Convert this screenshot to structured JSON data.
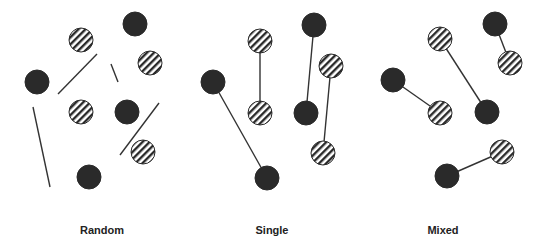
{
  "colors": {
    "dark": "#2a2a2a",
    "hatch": "#2a2a2a",
    "line": "#333333",
    "background": "#ffffff"
  },
  "circle_radius": 12,
  "panels": [
    {
      "label": "Random",
      "label_x": 102,
      "circles": [
        {
          "type": "hatched",
          "x": 81,
          "y": 40
        },
        {
          "type": "dark",
          "x": 135,
          "y": 24
        },
        {
          "type": "hatched",
          "x": 150,
          "y": 63
        },
        {
          "type": "dark",
          "x": 37,
          "y": 82
        },
        {
          "type": "hatched",
          "x": 81,
          "y": 112
        },
        {
          "type": "dark",
          "x": 127,
          "y": 112
        },
        {
          "type": "hatched",
          "x": 143,
          "y": 152
        },
        {
          "type": "dark",
          "x": 89,
          "y": 177
        }
      ],
      "lines": [
        {
          "x1": 58,
          "y1": 94,
          "x2": 97,
          "y2": 54
        },
        {
          "x1": 111,
          "y1": 64,
          "x2": 118,
          "y2": 82
        },
        {
          "x1": 33,
          "y1": 107,
          "x2": 50,
          "y2": 187
        },
        {
          "x1": 120,
          "y1": 155,
          "x2": 159,
          "y2": 103
        }
      ]
    },
    {
      "label": "Single",
      "label_x": 272,
      "circles": [
        {
          "type": "hatched",
          "x": 260,
          "y": 41
        },
        {
          "type": "hatched",
          "x": 260,
          "y": 113
        },
        {
          "type": "dark",
          "x": 314,
          "y": 25
        },
        {
          "type": "dark",
          "x": 306,
          "y": 113
        },
        {
          "type": "hatched",
          "x": 331,
          "y": 66
        },
        {
          "type": "hatched",
          "x": 323,
          "y": 153
        },
        {
          "type": "dark",
          "x": 213,
          "y": 82
        },
        {
          "type": "dark",
          "x": 267,
          "y": 178
        }
      ],
      "lines": [
        {
          "x1": 260,
          "y1": 41,
          "x2": 260,
          "y2": 113
        },
        {
          "x1": 314,
          "y1": 25,
          "x2": 306,
          "y2": 113
        },
        {
          "x1": 331,
          "y1": 66,
          "x2": 323,
          "y2": 153
        },
        {
          "x1": 213,
          "y1": 82,
          "x2": 267,
          "y2": 178
        }
      ]
    },
    {
      "label": "Mixed",
      "label_x": 443,
      "circles": [
        {
          "type": "dark",
          "x": 495,
          "y": 24
        },
        {
          "type": "hatched",
          "x": 510,
          "y": 63
        },
        {
          "type": "hatched",
          "x": 440,
          "y": 39
        },
        {
          "type": "dark",
          "x": 487,
          "y": 112
        },
        {
          "type": "dark",
          "x": 393,
          "y": 80
        },
        {
          "type": "hatched",
          "x": 440,
          "y": 113
        },
        {
          "type": "hatched",
          "x": 502,
          "y": 152
        },
        {
          "type": "dark",
          "x": 447,
          "y": 176
        }
      ],
      "lines": [
        {
          "x1": 495,
          "y1": 24,
          "x2": 510,
          "y2": 63
        },
        {
          "x1": 440,
          "y1": 39,
          "x2": 487,
          "y2": 112
        },
        {
          "x1": 393,
          "y1": 80,
          "x2": 440,
          "y2": 113
        },
        {
          "x1": 502,
          "y1": 152,
          "x2": 447,
          "y2": 176
        }
      ]
    }
  ]
}
